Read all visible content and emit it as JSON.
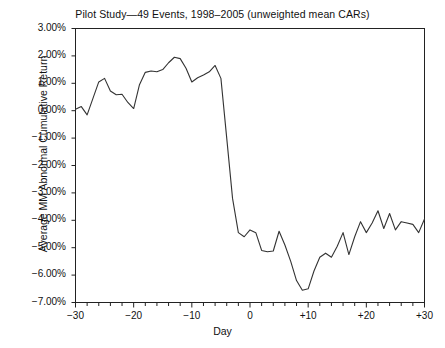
{
  "chart_data": {
    "type": "line",
    "title": "Pilot Study—49 Events, 1998–2005 (unweighted mean CARs)",
    "xlabel": "Day",
    "ylabel": "Average MM Abnormal Cumulative Return",
    "xlim": [
      -30,
      30
    ],
    "ylim": [
      -7,
      3
    ],
    "grid": false,
    "legend": null,
    "y_tick_labels": [
      "3.00%",
      "2.00%",
      "1.00%",
      "0.00%",
      "-1.00%",
      "-2.00%",
      "-3.00%",
      "-4.00%",
      "-5.00%",
      "-6.00%",
      "-7.00%"
    ],
    "y_tick_values": [
      3,
      2,
      1,
      0,
      -1,
      -2,
      -3,
      -4,
      -5,
      -6,
      -7
    ],
    "x_tick_labels": [
      "-30",
      "-20",
      "-10",
      "0",
      "+10",
      "+20",
      "+30"
    ],
    "x_tick_values": [
      -30,
      -20,
      -10,
      0,
      10,
      20,
      30
    ],
    "x_minor_tick_step": 2,
    "series_name": "Average MM Abnormal Cumulative Return",
    "line_color": "#333333",
    "x": [
      -30,
      -29,
      -28,
      -27,
      -26,
      -25,
      -24,
      -23,
      -22,
      -21,
      -20,
      -19,
      -18,
      -17,
      -16,
      -15,
      -14,
      -13,
      -12,
      -11,
      -10,
      -9,
      -8,
      -7,
      -6,
      -5,
      -4,
      -3,
      -2,
      -1,
      0,
      1,
      2,
      3,
      4,
      5,
      6,
      7,
      8,
      9,
      10,
      11,
      12,
      13,
      14,
      15,
      16,
      17,
      18,
      19,
      20,
      21,
      22,
      23,
      24,
      25,
      26,
      27,
      28,
      29,
      30
    ],
    "values": [
      0.05,
      0.15,
      -0.15,
      0.45,
      1.05,
      1.18,
      0.72,
      0.58,
      0.6,
      0.3,
      0.08,
      0.95,
      1.4,
      1.45,
      1.42,
      1.5,
      1.75,
      1.95,
      1.9,
      1.55,
      1.05,
      1.2,
      1.3,
      1.42,
      1.65,
      1.18,
      -1.0,
      -3.2,
      -4.45,
      -4.6,
      -4.35,
      -4.45,
      -5.1,
      -5.15,
      -5.12,
      -4.4,
      -4.9,
      -5.5,
      -6.2,
      -6.55,
      -6.5,
      -5.85,
      -5.35,
      -5.2,
      -5.35,
      -4.95,
      -4.45,
      -5.25,
      -4.6,
      -4.05,
      -4.45,
      -4.1,
      -3.65,
      -4.3,
      -3.75,
      -4.35,
      -4.05,
      -4.1,
      -4.15,
      -4.45,
      -3.95
    ]
  }
}
